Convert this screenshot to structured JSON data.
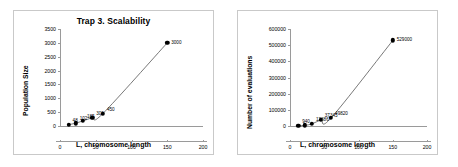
{
  "figure": {
    "panel_count": 2,
    "background": "#ffffff",
    "frame_color": "#c9c9c9",
    "marker_color": "#000000",
    "curve_color": "#555555",
    "axis_color": "#9a9a9a"
  },
  "chart_data": [
    {
      "type": "scatter",
      "title": "Trap 3. Scalability",
      "xlabel": "L, chromosome length",
      "ylabel": "Population Size",
      "xlim": [
        0,
        200
      ],
      "ylim": [
        0,
        3500
      ],
      "xticks": [
        0,
        50,
        100,
        150,
        200
      ],
      "xtick_labels": [
        "0",
        "50",
        "100",
        "150",
        "200"
      ],
      "yticks": [
        0,
        500,
        1000,
        1500,
        2000,
        2500,
        3000,
        3500
      ],
      "ytick_labels": [
        "0",
        "500",
        "1000",
        "1500",
        "2000",
        "2500",
        "3000",
        "3500"
      ],
      "grid": false,
      "legend": false,
      "x": [
        12,
        22,
        32,
        45,
        60,
        150
      ],
      "values": [
        48,
        102,
        185,
        300,
        450,
        3000
      ],
      "point_labels": [
        "48",
        "102",
        "185",
        "300",
        "450",
        "3000"
      ],
      "has_fit_curve": true,
      "fit_curve_note": "smooth increasing trend through all markers"
    },
    {
      "type": "scatter",
      "title": "",
      "xlabel": "L, chromosome length",
      "ylabel": "Number of evaluations",
      "xlim": [
        0,
        200
      ],
      "ylim": [
        0,
        600000
      ],
      "xticks": [
        0,
        50,
        100,
        150,
        200
      ],
      "xtick_labels": [
        "0",
        "50",
        "100",
        "150",
        "200"
      ],
      "yticks": [
        0,
        100000,
        200000,
        300000,
        400000,
        500000,
        600000
      ],
      "ytick_labels": [
        "0",
        "100000",
        "200000",
        "300000",
        "400000",
        "500000",
        "600000"
      ],
      "grid": false,
      "legend": false,
      "x": [
        12,
        22,
        32,
        45,
        60,
        150
      ],
      "values": [
        940,
        4200,
        12886,
        37345,
        49820,
        529000
      ],
      "point_labels": [
        "940",
        "",
        "12886",
        "37345",
        "49820",
        "529000"
      ],
      "has_fit_curve": true,
      "fit_curve_note": "smooth increasing trend through all markers"
    }
  ]
}
